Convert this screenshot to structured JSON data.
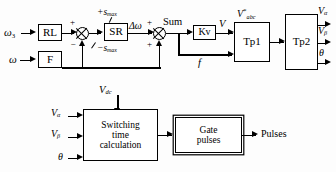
{
  "diagram": {
    "inputs": {
      "omega_ref": "ω₃",
      "omega": "ω",
      "vdc": "V",
      "vdc_sub": "dc",
      "v_alpha": "V",
      "v_alpha_sub": "α",
      "v_beta": "V",
      "v_beta_sub": "β",
      "theta": "θ"
    },
    "blocks": {
      "rl": "RL",
      "f": "F",
      "sr": "SR",
      "kv": "Kv",
      "tp1": "Tp1",
      "tp2": "Tp2",
      "switching": "Switching\ntime\ncalculation",
      "switching_l1": "Switching",
      "switching_l2": "time",
      "switching_l3": "calculation",
      "gate_l1": "Gate",
      "gate_l2": "pulses"
    },
    "signals": {
      "s_max_pos": "+s",
      "s_max_pos_sub": "max",
      "s_max_neg": "−s",
      "s_max_neg_sub": "max",
      "delta_omega": "Δω",
      "sum": "Sum",
      "v": "V",
      "f": "f",
      "v_abc_star": "V",
      "v_abc_star_sup": "*",
      "v_abc_star_sub": "abc",
      "out_v_alpha": "V",
      "out_v_alpha_sub": "α",
      "out_v_beta": "V",
      "out_v_beta_sub": "β",
      "out_theta": "θ",
      "pulses": "Pulses"
    },
    "signs": {
      "j1_plus": "+",
      "j1_minus": "−",
      "j2_plus_top": "+",
      "j2_plus_bottom": "+"
    },
    "colors": {
      "line": "#000000",
      "background": "#fdfdfd",
      "block_fill": "#ffffff"
    }
  }
}
